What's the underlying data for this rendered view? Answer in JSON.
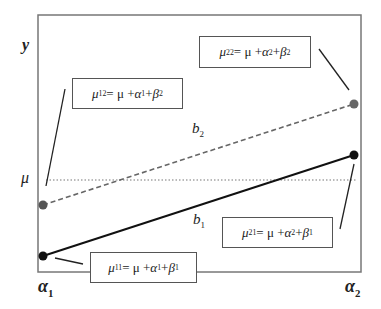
{
  "diagram": {
    "axis": {
      "y_label": "y",
      "mu_label": "μ",
      "x_label_1": {
        "base": "α",
        "sub": "1"
      },
      "x_label_2": {
        "base": "α",
        "sub": "2"
      }
    },
    "lines": [
      {
        "name": "b2",
        "label": {
          "base": "b",
          "sub": "2"
        },
        "style": "dashed",
        "color": "#666666",
        "from": "mu12",
        "to": "mu22"
      },
      {
        "name": "b1",
        "label": {
          "base": "b",
          "sub": "1"
        },
        "style": "solid",
        "color": "#111111",
        "from": "mu11",
        "to": "mu21"
      },
      {
        "name": "mu-reference",
        "style": "dotted",
        "color": "#666666"
      }
    ],
    "points": {
      "mu11": {
        "color": "#111111"
      },
      "mu12": {
        "color": "#555555"
      },
      "mu21": {
        "color": "#111111"
      },
      "mu22": {
        "color": "#666666"
      }
    },
    "boxes": {
      "mu12": {
        "lhs": "μ",
        "lhs_sub": "12",
        "eq": " = μ + ",
        "a": "α",
        "a_sub": "1",
        "plus": " + ",
        "b": "β",
        "b_sub": "2"
      },
      "mu22": {
        "lhs": "μ",
        "lhs_sub": "22",
        "eq": " = μ + ",
        "a": "α",
        "a_sub": "2",
        "plus": " + ",
        "b": "β",
        "b_sub": "2"
      },
      "mu21": {
        "lhs": "μ",
        "lhs_sub": "21",
        "eq": " = μ + ",
        "a": "α",
        "a_sub": "2",
        "plus": " + ",
        "b": "β",
        "b_sub": "1"
      },
      "mu11": {
        "lhs": "μ",
        "lhs_sub": "11",
        "eq": " = μ + ",
        "a": "α",
        "a_sub": "1",
        "plus": " + ",
        "b": "β",
        "b_sub": "1"
      }
    }
  }
}
